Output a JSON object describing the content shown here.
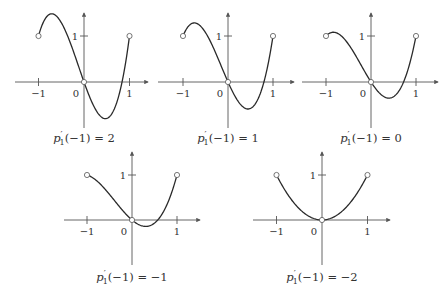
{
  "figure": {
    "axis_color": "#555555",
    "curve_color": "#2a2a2a",
    "marker_fill": "#ffffff",
    "marker_stroke": "#555555"
  },
  "chart_data": [
    {
      "type": "line",
      "title": "p'_1(-1) = 2",
      "caption": {
        "fn": "p",
        "prime": "′",
        "sub": "1",
        "arg": "(−1)",
        "rhs": "= 2"
      },
      "function": "cubic through (-1,1), (0,0), (1,1)",
      "xlim": [
        -1,
        1
      ],
      "xticks": [
        {
          "x": -1,
          "label": "−1"
        },
        {
          "x": 1,
          "label": "1"
        }
      ],
      "yticks": [
        {
          "y": 1,
          "label": "1"
        }
      ],
      "origin_label": "0",
      "open_points": [
        [
          -1,
          1
        ],
        [
          0,
          0
        ],
        [
          1,
          1
        ]
      ],
      "drawn_coeff_a": 2.78,
      "approx_extrema": {
        "max": [
          -0.68,
          1.35
        ],
        "min": [
          0.41,
          -0.78
        ]
      },
      "layout": {
        "ox": 84,
        "oy": 82,
        "sx": 45.5,
        "sy": 46,
        "xmin": 15,
        "xmax": 148,
        "ytop": 13,
        "ybot": 128,
        "cap_y": 142
      }
    },
    {
      "type": "line",
      "title": "p'_1(-1) = 1",
      "caption": {
        "fn": "p",
        "prime": "′",
        "sub": "1",
        "arg": "(−1)",
        "rhs": "= 1"
      },
      "function": "cubic through (-1,1), (0,0), (1,1)",
      "xlim": [
        -1,
        1
      ],
      "xticks": [
        {
          "x": -1,
          "label": "−1"
        },
        {
          "x": 1,
          "label": "1"
        }
      ],
      "yticks": [
        {
          "y": 1,
          "label": "1"
        }
      ],
      "origin_label": "0",
      "open_points": [
        [
          -1,
          1
        ],
        [
          0,
          0
        ],
        [
          1,
          1
        ]
      ],
      "drawn_coeff_a": 2.2,
      "approx_extrema": {
        "max": [
          -0.75,
          1.16
        ],
        "min": [
          0.38,
          -0.57
        ]
      },
      "layout": {
        "ox": 228,
        "oy": 82,
        "sx": 45,
        "sy": 46,
        "xmin": 158,
        "xmax": 294,
        "ytop": 13,
        "ybot": 128,
        "cap_y": 142
      }
    },
    {
      "type": "line",
      "title": "p'_1(-1) = 0",
      "caption": {
        "fn": "p",
        "prime": "′",
        "sub": "1",
        "arg": "(−1)",
        "rhs": "= 0"
      },
      "function": "cubic through (-1,1), (0,0), (1,1)",
      "xlim": [
        -1,
        1
      ],
      "xticks": [
        {
          "x": -1,
          "label": "−1"
        },
        {
          "x": 1,
          "label": "1"
        }
      ],
      "yticks": [
        {
          "y": 1,
          "label": "1"
        }
      ],
      "origin_label": "0",
      "open_points": [
        [
          -1,
          1
        ],
        [
          0,
          0
        ],
        [
          1,
          1
        ]
      ],
      "drawn_coeff_a": 1.52,
      "approx_extrema": {
        "min": [
          0.31,
          -0.33
        ]
      },
      "layout": {
        "ox": 371,
        "oy": 82,
        "sx": 45,
        "sy": 46,
        "xmin": 302,
        "xmax": 438,
        "ytop": 13,
        "ybot": 128,
        "cap_y": 142
      }
    },
    {
      "type": "line",
      "title": "p'_1(-1) = -1",
      "caption": {
        "fn": "p",
        "prime": "′",
        "sub": "1",
        "arg": "(−1)",
        "rhs": "= −1"
      },
      "function": "cubic through (-1,1), (0,0), (1,1)",
      "xlim": [
        -1,
        1
      ],
      "xticks": [
        {
          "x": -1,
          "label": "−1"
        },
        {
          "x": 1,
          "label": "1"
        }
      ],
      "yticks": [
        {
          "y": 1,
          "label": "1"
        }
      ],
      "origin_label": "0",
      "open_points": [
        [
          -1,
          1
        ],
        [
          0,
          0
        ],
        [
          1,
          1
        ]
      ],
      "drawn_coeff_a": 0.85,
      "approx_extrema": {
        "min": [
          0.22,
          -0.13
        ]
      },
      "layout": {
        "ox": 132,
        "oy": 220,
        "sx": 45,
        "sy": 45,
        "xmin": 64,
        "xmax": 200,
        "ytop": 152,
        "ybot": 265,
        "cap_y": 281
      }
    },
    {
      "type": "line",
      "title": "p'_1(-1) = -2",
      "caption": {
        "fn": "p",
        "prime": "′",
        "sub": "1",
        "arg": "(−1)",
        "rhs": "= −2"
      },
      "function": "x^2",
      "xlim": [
        -1,
        1
      ],
      "xticks": [
        {
          "x": -1,
          "label": "−1"
        },
        {
          "x": 1,
          "label": "1"
        }
      ],
      "yticks": [
        {
          "y": 1,
          "label": "1"
        }
      ],
      "origin_label": "0",
      "open_points": [
        [
          -1,
          1
        ],
        [
          0,
          0
        ],
        [
          1,
          1
        ]
      ],
      "drawn_coeff_a": 0,
      "approx_extrema": {
        "min": [
          0,
          0
        ]
      },
      "layout": {
        "ox": 322,
        "oy": 220,
        "sx": 45.5,
        "sy": 45,
        "xmin": 253,
        "xmax": 390,
        "ytop": 152,
        "ybot": 265,
        "cap_y": 281
      }
    }
  ]
}
